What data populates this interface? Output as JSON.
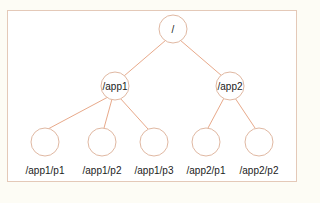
{
  "diagram": {
    "type": "tree",
    "edge_color": "#e8a98a",
    "node_stroke": "#e0b8a2",
    "nodes": {
      "root": {
        "label": "/",
        "x": 173,
        "y": 29
      },
      "app1": {
        "label": "/app1",
        "x": 115,
        "y": 86
      },
      "app2": {
        "label": "/app2",
        "x": 230,
        "y": 86
      },
      "app1_p1": {
        "label": "/app1/p1",
        "x": 45,
        "y": 142
      },
      "app1_p2": {
        "label": "/app1/p2",
        "x": 102,
        "y": 142
      },
      "app1_p3": {
        "label": "/app1/p3",
        "x": 154,
        "y": 142
      },
      "app2_p1": {
        "label": "/app2/p1",
        "x": 206,
        "y": 142
      },
      "app2_p2": {
        "label": "/app2/p2",
        "x": 259,
        "y": 142
      }
    },
    "edges": [
      [
        "root",
        "app1"
      ],
      [
        "root",
        "app2"
      ],
      [
        "app1",
        "app1_p1"
      ],
      [
        "app1",
        "app1_p2"
      ],
      [
        "app1",
        "app1_p3"
      ],
      [
        "app2",
        "app2_p1"
      ],
      [
        "app2",
        "app2_p2"
      ]
    ]
  }
}
